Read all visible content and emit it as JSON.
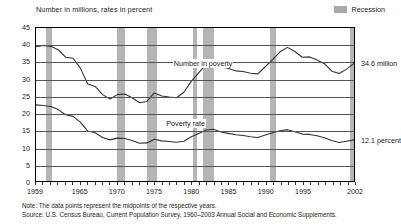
{
  "chart_data": {
    "type": "line",
    "title": "Number in millions, rates in percent",
    "xlabel": "",
    "ylabel": "",
    "ylim": [
      0,
      45
    ],
    "yticks": [
      0,
      5,
      10,
      15,
      20,
      25,
      30,
      35,
      40,
      45
    ],
    "xlim": [
      1959,
      2002
    ],
    "xticks": [
      1959,
      1965,
      1970,
      1975,
      1980,
      1985,
      1990,
      1995,
      2002
    ],
    "grid": true,
    "legend_position": "top-right",
    "legend": [
      {
        "label": "Recession",
        "color": "#b5b5b5",
        "kind": "band"
      }
    ],
    "annotations": [
      {
        "text": "Number in poverty",
        "x": 1981,
        "y": 34.5
      },
      {
        "text": "Poverty rate",
        "x": 1980,
        "y": 17.0
      },
      {
        "text": "34.6 million",
        "x": 2002,
        "y": 34.6,
        "placement": "right"
      },
      {
        "text": "12.1 percent",
        "x": 2002,
        "y": 12.1,
        "placement": "right"
      }
    ],
    "x": [
      1959,
      1960,
      1961,
      1962,
      1963,
      1964,
      1965,
      1966,
      1967,
      1968,
      1969,
      1970,
      1971,
      1972,
      1973,
      1974,
      1975,
      1976,
      1977,
      1978,
      1979,
      1980,
      1981,
      1982,
      1983,
      1984,
      1985,
      1986,
      1987,
      1988,
      1989,
      1990,
      1991,
      1992,
      1993,
      1994,
      1995,
      1996,
      1997,
      1998,
      1999,
      2000,
      2001,
      2002
    ],
    "series": [
      {
        "name": "Number in poverty",
        "units": "millions",
        "color": "#333333",
        "values": [
          39.5,
          39.9,
          39.6,
          38.6,
          36.4,
          36.1,
          33.2,
          28.5,
          27.8,
          25.4,
          24.1,
          25.4,
          25.6,
          24.5,
          23.0,
          23.4,
          25.9,
          25.0,
          24.7,
          24.5,
          26.1,
          29.3,
          31.8,
          34.4,
          35.3,
          33.7,
          33.1,
          32.4,
          32.2,
          31.7,
          31.5,
          33.6,
          35.7,
          38.0,
          39.3,
          38.1,
          36.4,
          36.5,
          35.6,
          34.5,
          32.3,
          31.6,
          32.9,
          34.6
        ]
      },
      {
        "name": "Poverty rate",
        "units": "percent",
        "color": "#333333",
        "values": [
          22.4,
          22.2,
          21.9,
          21.0,
          19.5,
          19.0,
          17.3,
          14.7,
          14.2,
          12.8,
          12.1,
          12.6,
          12.5,
          11.9,
          11.1,
          11.2,
          12.3,
          11.8,
          11.6,
          11.4,
          11.7,
          13.0,
          14.0,
          15.0,
          15.2,
          14.4,
          14.0,
          13.6,
          13.4,
          13.0,
          12.8,
          13.5,
          14.2,
          14.8,
          15.1,
          14.5,
          13.8,
          13.7,
          13.3,
          12.7,
          11.9,
          11.3,
          11.7,
          12.1
        ]
      }
    ],
    "recessions": [
      {
        "start": 1960.3,
        "end": 1961.2
      },
      {
        "start": 1969.9,
        "end": 1970.9
      },
      {
        "start": 1973.9,
        "end": 1975.2
      },
      {
        "start": 1980.1,
        "end": 1980.6
      },
      {
        "start": 1981.5,
        "end": 1982.9
      },
      {
        "start": 1990.5,
        "end": 1991.2
      },
      {
        "start": 2001.2,
        "end": 2001.9
      }
    ]
  },
  "notes": {
    "note_line": "Note:  The data points represent the midpoints of the respective years.",
    "source_line": "Source:  U.S. Census Bureau, Current Population Survey, 1960–2003 Annual Social and Economic Supplements."
  }
}
